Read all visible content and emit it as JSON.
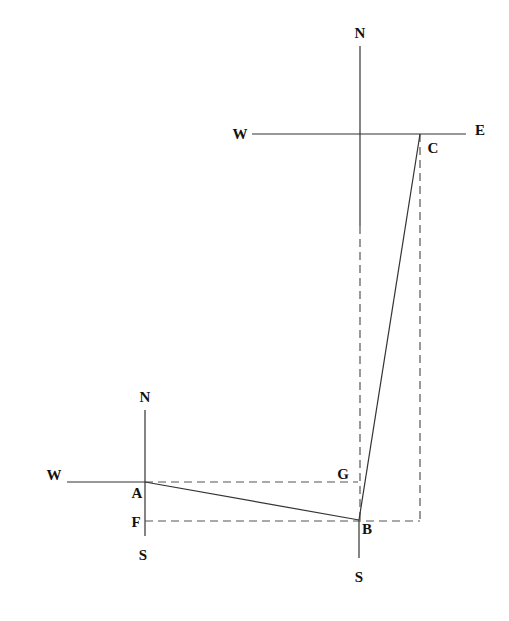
{
  "diagram": {
    "type": "vector-displacement-compass-diagram",
    "colors": {
      "line": "#333333",
      "dashed": "#555555",
      "text": "#111111",
      "background": "#ffffff"
    },
    "compass_upper": {
      "north_label": "N",
      "west_label": "W",
      "east_label": "E"
    },
    "compass_lower_left": {
      "north_label": "N",
      "west_label": "W",
      "south_label": "S"
    },
    "compass_lower_right": {
      "south_label": "S"
    },
    "points": {
      "A": "A",
      "B": "B",
      "C": "C",
      "F": "F",
      "G": "G"
    }
  }
}
